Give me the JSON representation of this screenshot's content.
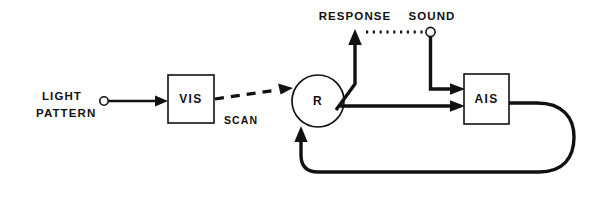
{
  "diagram": {
    "title": "",
    "type": "block-flow-diagram",
    "colors": {
      "stroke": "#111111",
      "background": "#ffffff"
    },
    "nodes": {
      "vis": {
        "label": "VIS",
        "shape": "rectangle"
      },
      "r": {
        "label": "R",
        "shape": "circle"
      },
      "ais": {
        "label": "AIS",
        "shape": "rectangle"
      }
    },
    "terminals": {
      "light_pattern": {
        "line1": "LIGHT",
        "line2": "PATTERN",
        "marker": "open-circle"
      },
      "response": {
        "label": "RESPONSE",
        "marker": "arrow-up"
      },
      "sound": {
        "label": "SOUND",
        "marker": "open-circle"
      }
    },
    "edges": {
      "scan": {
        "label": "SCAN",
        "style": "dashed",
        "from": "vis",
        "to": "r"
      },
      "light_to_vis": {
        "label": "",
        "style": "solid",
        "from": "light_pattern",
        "to": "vis"
      },
      "r_to_response": {
        "label": "",
        "style": "solid",
        "from": "r",
        "to": "response"
      },
      "sound_to_ais": {
        "label": "",
        "style": "solid",
        "from": "sound",
        "to": "ais"
      },
      "response_sound_link": {
        "label": "",
        "style": "dotted",
        "from": "response",
        "to": "sound"
      },
      "r_to_ais": {
        "label": "",
        "style": "solid",
        "from": "r",
        "to": "ais"
      },
      "ais_feedback_to_r": {
        "label": "",
        "style": "solid-loop",
        "from": "ais",
        "to": "r"
      }
    }
  }
}
